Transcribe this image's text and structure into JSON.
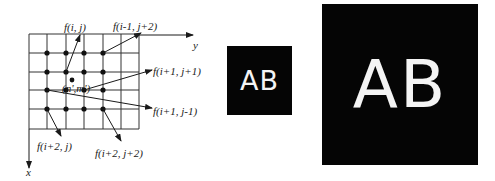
{
  "diagram": {
    "axes": {
      "x_label": "x",
      "y_label": "y"
    },
    "grid": {
      "rows": 5,
      "cols": 6
    },
    "interpolated_point_label": "(n',m')",
    "labels": {
      "f_i_j": "f(i, j)",
      "f_im1_jp2": "f(i-1, j+2)",
      "f_ip1_jp1": "f(i+1, j+1)",
      "f_ip1_jm1": "f(i+1, j-1)",
      "f_ip2_j": "f(i+2, j)",
      "f_ip2_jp2": "f(i+2, j+2)"
    }
  },
  "images": {
    "small": {
      "text": "AB",
      "background": "#050505",
      "foreground": "#f4f4f4"
    },
    "large": {
      "text": "AB",
      "background": "#050505",
      "foreground": "#f4f4f4"
    }
  }
}
